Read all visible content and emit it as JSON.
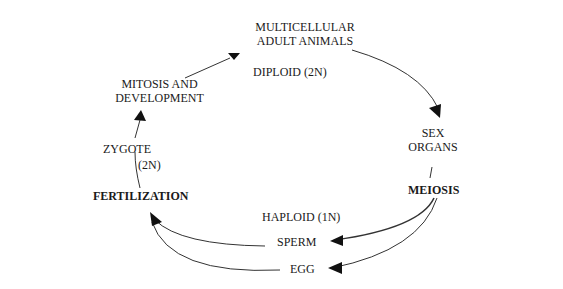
{
  "diagram": {
    "type": "life-cycle",
    "nodes": {
      "adult": {
        "line1": "MULTICELLULAR",
        "line2": "ADULT ANIMALS"
      },
      "diploid_top": "DIPLOID  (2N)",
      "sex_organs": {
        "line1": "SEX",
        "line2": "ORGANS"
      },
      "meiosis": "MEIOSIS",
      "haploid": "HAPLOID   (1N)",
      "sperm": "SPERM",
      "egg": "EGG",
      "fertilization": "FERTILIZATION",
      "zygote": "ZYGOTE",
      "zygote_ploidy": "(2N)",
      "mitosis": {
        "line1": "MITOSIS AND",
        "line2": "DEVELOPMENT"
      }
    },
    "edges": [
      {
        "from": "MULTICELLULAR ADULT ANIMALS",
        "to": "SEX ORGANS"
      },
      {
        "from": "SEX ORGANS",
        "to": "MEIOSIS"
      },
      {
        "from": "MEIOSIS",
        "to": "SPERM"
      },
      {
        "from": "MEIOSIS",
        "to": "EGG"
      },
      {
        "from": "SPERM",
        "to": "FERTILIZATION"
      },
      {
        "from": "EGG",
        "to": "FERTILIZATION"
      },
      {
        "from": "FERTILIZATION",
        "to": "ZYGOTE"
      },
      {
        "from": "ZYGOTE",
        "to": "MITOSIS AND DEVELOPMENT"
      },
      {
        "from": "MITOSIS AND DEVELOPMENT",
        "to": "MULTICELLULAR ADULT ANIMALS"
      }
    ]
  }
}
